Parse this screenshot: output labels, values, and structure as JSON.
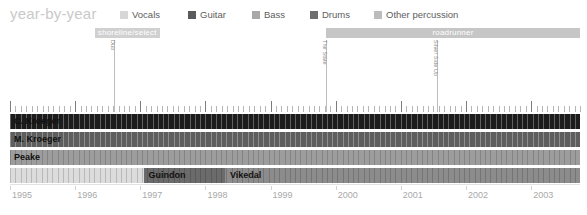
{
  "chart_data": {
    "type": "timeline",
    "title": "year-by-year",
    "xlabel": "",
    "ylabel": "",
    "xlim": [
      1995,
      2003.75
    ],
    "tick_labels": [
      "1995",
      "1996",
      "1997",
      "1998",
      "1999",
      "2000",
      "2001",
      "2002",
      "2003"
    ],
    "tick_values": [
      1995,
      1996,
      1997,
      1998,
      1999,
      2000,
      2001,
      2002,
      2003
    ],
    "grid": true,
    "legend_position": "top",
    "legend": [
      {
        "label": "Vocals",
        "color": "#d7d7d7"
      },
      {
        "label": "Guitar",
        "color": "#5a5a5a"
      },
      {
        "label": "Bass",
        "color": "#a8a8a8"
      },
      {
        "label": "Drums",
        "color": "#6e6e6e"
      },
      {
        "label": "Other percussion",
        "color": "#bcbcbc"
      }
    ],
    "eras": [
      {
        "label": "shoreline/select",
        "start": 1996.3,
        "end": 1997.3,
        "color": "#d0d0d0"
      },
      {
        "label": "roadrunner",
        "start": 1999.85,
        "end": 2003.75,
        "color": "#c6c6c6"
      }
    ],
    "albums": [
      {
        "label": "Dub",
        "year": 1996.6
      },
      {
        "label": "The State",
        "year": 1999.85
      },
      {
        "label": "Silver Side Up",
        "year": 2001.55
      }
    ],
    "members": [
      {
        "name": "C. Kroeger",
        "start": 1995.0,
        "end": 2003.75,
        "color": "#1c1c1c",
        "label_light": false,
        "roles": "Vocals, Guitar"
      },
      {
        "name": "M. Kroeger",
        "start": 1995.0,
        "end": 2003.75,
        "color": "#5e5e5e",
        "label_light": false,
        "roles": "Bass"
      },
      {
        "name": "Peake",
        "start": 1995.0,
        "end": 2003.75,
        "color": "#9d9d9d",
        "label_light": false,
        "roles": "Guitar"
      },
      {
        "name": "Guindon",
        "start": 1995.0,
        "end": 1998.3,
        "color": "#6b6b6b",
        "label_light": false,
        "roles": "Drums",
        "segments": [
          {
            "start": 1995.0,
            "end": 1997.05,
            "color": "#d0d0d0",
            "label": ""
          },
          {
            "start": 1997.05,
            "end": 1998.3,
            "color": "#6b6b6b",
            "label": "Guindon"
          }
        ]
      },
      {
        "name": "Vikedal",
        "start": 1998.3,
        "end": 2003.75,
        "color": "#8c8c8c",
        "label_light": false,
        "roles": "Drums"
      }
    ],
    "rows": [
      {
        "label": "C. Kroeger",
        "bar_color": "#1c1c1c",
        "start": 1995.0,
        "end": 2003.75,
        "label_color": "#111111"
      },
      {
        "label": "M. Kroeger",
        "bar_color": "#5e5e5e",
        "start": 1995.0,
        "end": 2003.75,
        "label_color": "#111111"
      },
      {
        "label": "Peake",
        "bar_color": "#9d9d9d",
        "start": 1995.0,
        "end": 2003.75,
        "label_color": "#111111"
      }
    ],
    "drummer_row": {
      "pre_color": "#dcdcdc",
      "guindon": {
        "label": "Guindon",
        "start": 1997.05,
        "end": 1998.3,
        "color": "#6b6b6b"
      },
      "vikedal": {
        "label": "Vikedal",
        "start": 1998.3,
        "end": 2003.75,
        "color": "#8c8c8c"
      }
    }
  },
  "header": {
    "title": "year-by-year"
  },
  "legend": {
    "items": [
      {
        "label": "Vocals"
      },
      {
        "label": "Guitar"
      },
      {
        "label": "Bass"
      },
      {
        "label": "Drums"
      },
      {
        "label": "Other percussion"
      }
    ]
  },
  "eras": {
    "items": [
      {
        "label": "shoreline/select"
      },
      {
        "label": "roadrunner"
      }
    ]
  },
  "albums": {
    "items": [
      {
        "label": "Dub"
      },
      {
        "label": "The State"
      },
      {
        "label": "Silver Side Up"
      }
    ]
  },
  "rows": {
    "items": [
      {
        "label": "C. Kroeger"
      },
      {
        "label": "M. Kroeger"
      },
      {
        "label": "Peake"
      },
      {
        "label": "Guindon"
      },
      {
        "label": "Vikedal"
      }
    ]
  },
  "axis": {
    "labels": [
      "1995",
      "1996",
      "1997",
      "1998",
      "1999",
      "2000",
      "2001",
      "2002",
      "2003"
    ]
  },
  "colors": {
    "vocals": "#d7d7d7",
    "guitar": "#5a5a5a",
    "bass": "#a8a8a8",
    "drums": "#6e6e6e",
    "other_percussion": "#bcbcbc",
    "title": "#c9c9c9",
    "era_band": "#c6c6c6",
    "axis_text": "#a9a9a9"
  }
}
